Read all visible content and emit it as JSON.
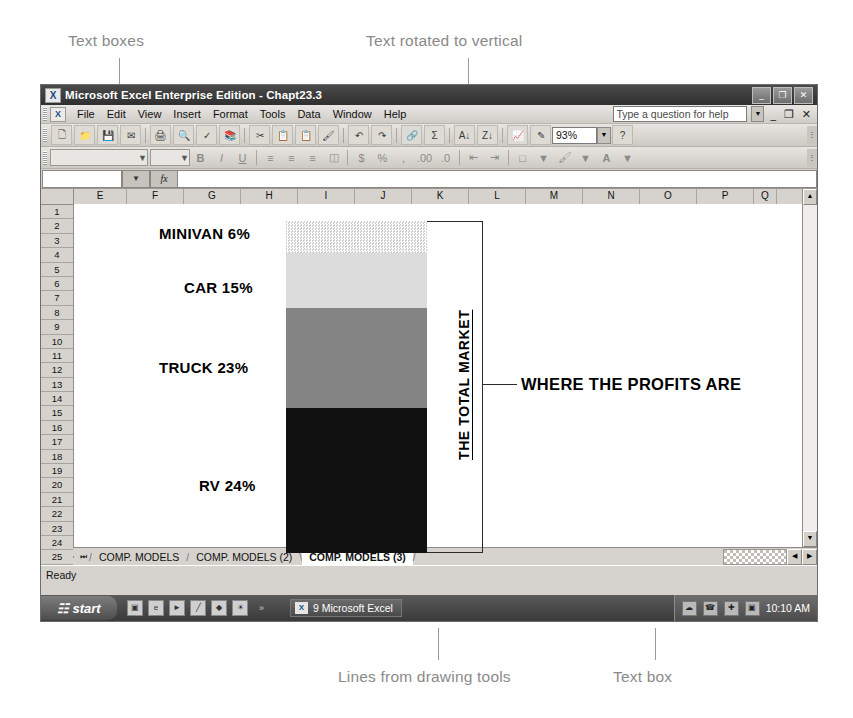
{
  "annotations": {
    "text_boxes": "Text boxes",
    "text_rotated": "Text rotated to vertical",
    "lines_drawing": "Lines from drawing tools",
    "text_box": "Text box"
  },
  "window": {
    "title": "Microsoft Excel Enterprise Edition - Chapt23.3",
    "app_icon": "excel-icon",
    "buttons": {
      "minimize": "_",
      "restore": "❐",
      "close": "✕"
    }
  },
  "menu": {
    "icon": "excel-doc-icon",
    "items": [
      "File",
      "Edit",
      "View",
      "Insert",
      "Format",
      "Tools",
      "Data",
      "Window",
      "Help"
    ],
    "help_placeholder": "Type a question for help",
    "help_value": "Type a question for help",
    "doc_minimize": "_",
    "doc_restore": "❐",
    "doc_close": "✕"
  },
  "toolbar": {
    "standard_icons": [
      "new-icon",
      "open-icon",
      "save-icon",
      "mail-icon",
      "print-icon",
      "print-preview-icon",
      "spelling-icon",
      "research-icon",
      "cut-icon",
      "copy-icon",
      "paste-icon",
      "format-painter-icon",
      "undo-icon",
      "redo-icon",
      "hyperlink-icon",
      "autosum-icon",
      "sort-asc-icon",
      "sort-desc-icon",
      "chart-wizard-icon",
      "drawing-icon"
    ],
    "zoom_value": "93%",
    "help_icon": "help-icon",
    "overflow_icon": "toolbar-overflow-icon"
  },
  "formatting": {
    "font_name": "",
    "font_size": "",
    "icons": [
      "bold-icon",
      "italic-icon",
      "underline-icon",
      "align-left-icon",
      "align-center-icon",
      "align-right-icon",
      "merge-center-icon",
      "currency-icon",
      "percent-icon",
      "comma-icon",
      "increase-decimal-icon",
      "decrease-decimal-icon",
      "decrease-indent-icon",
      "increase-indent-icon",
      "borders-icon",
      "fill-color-icon",
      "font-color-icon"
    ],
    "overflow_icon": "toolbar-overflow-icon"
  },
  "formula_bar": {
    "name_box_value": "",
    "fx_label": "fx",
    "formula_value": ""
  },
  "grid": {
    "columns": [
      "E",
      "F",
      "G",
      "H",
      "I",
      "J",
      "K",
      "L",
      "M",
      "N",
      "O",
      "P",
      "Q"
    ],
    "rows": [
      "1",
      "2",
      "3",
      "4",
      "5",
      "6",
      "7",
      "8",
      "9",
      "10",
      "11",
      "12",
      "13",
      "14",
      "15",
      "16",
      "17",
      "18",
      "19",
      "20",
      "21",
      "22",
      "23",
      "24",
      "25"
    ]
  },
  "chart_data": {
    "type": "bar",
    "title": "WHERE THE PROFITS ARE",
    "axis_title": "THE TOTAL MARKET",
    "categories": [
      "MINIVAN",
      "CAR",
      "TRUCK",
      "RV"
    ],
    "values": [
      6,
      15,
      23,
      24
    ],
    "labels": [
      "MINIVAN 6%",
      "CAR 15%",
      "TRUCK 23%",
      "RV 24%"
    ],
    "colors": [
      "#d8d8d8",
      "#dcdcdc",
      "#848484",
      "#111111"
    ],
    "unit": "%",
    "stacked": true,
    "legend": "none",
    "grid": false
  },
  "sheet_tabs": {
    "nav": [
      "⏮",
      "◀",
      "▶",
      "⏭"
    ],
    "tabs": [
      {
        "label": "COMP. MODELS",
        "active": false
      },
      {
        "label": "COMP. MODELS (2)",
        "active": false
      },
      {
        "label": "COMP. MODELS (3)",
        "active": true
      }
    ]
  },
  "status": {
    "text": "Ready"
  },
  "taskbar": {
    "start": "start",
    "quick_launch": [
      "app-icon",
      "browser-icon",
      "media-icon",
      "pen-icon",
      "diamond-icon",
      "sun-icon"
    ],
    "more": "»",
    "task": {
      "icon": "excel-icon",
      "label": "9 Microsoft Excel"
    },
    "tray_icons": [
      "network-icon",
      "phone-icon",
      "antivirus-icon",
      "monitor-icon"
    ],
    "clock": "10:10 AM"
  }
}
